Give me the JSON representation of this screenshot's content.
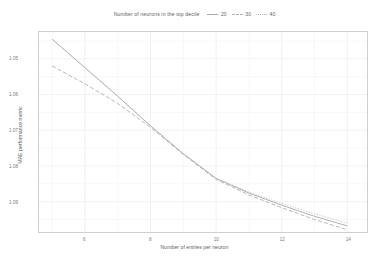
{
  "legend": {
    "title": "Number of neurons in the top decile",
    "entries": [
      {
        "label": "20",
        "color": "#a8a8a8",
        "dash": "none"
      },
      {
        "label": "30",
        "color": "#b0b0b0",
        "dash": "dashed"
      },
      {
        "label": "40",
        "color": "#bdbdbd",
        "dash": "dotted"
      }
    ]
  },
  "axes": {
    "xlabel": "Number of entries per neuron",
    "ylabel": "MAE performance metric",
    "xticks": [
      "6",
      "8",
      "10",
      "12",
      "14"
    ],
    "yticks": [
      "1.09",
      "1.08",
      "1.07",
      "1.06",
      "1.05"
    ]
  },
  "colors": {
    "frame": "#cfcfcf",
    "grid_major": "#ececec",
    "grid_minor": "#f4f4f4",
    "text": "#6b6b6b",
    "background": "#ffffff"
  },
  "chart_data": {
    "type": "line",
    "title": "Number of neurons in the top decile",
    "xlabel": "Number of entries per neuron",
    "ylabel": "MAE performance metric",
    "xlim": [
      4.6,
      14.6
    ],
    "ylim": [
      1.0415,
      1.0975
    ],
    "xticks": [
      6,
      8,
      10,
      12,
      14
    ],
    "yticks": [
      1.05,
      1.06,
      1.07,
      1.08,
      1.09
    ],
    "grid": true,
    "legend_position": "top-center",
    "x": [
      5,
      6,
      7,
      8,
      9,
      10,
      11,
      12,
      13,
      14
    ],
    "series": [
      {
        "name": "20",
        "color": "#a8a8a8",
        "dash": "none",
        "values": [
          1.0955,
          1.0875,
          1.0795,
          1.0712,
          1.0634,
          1.0565,
          1.0524,
          1.049,
          1.0459,
          1.0432
        ]
      },
      {
        "name": "30",
        "color": "#b0b0b0",
        "dash": "dashed",
        "values": [
          1.088,
          1.083,
          1.0775,
          1.0708,
          1.0632,
          1.0562,
          1.0519,
          1.0483,
          1.045,
          1.0421
        ]
      },
      {
        "name": "40",
        "color": "#bdbdbd",
        "dash": "dotted",
        "values": [
          1.0955,
          1.0876,
          1.0796,
          1.0713,
          1.0635,
          1.0566,
          1.0527,
          1.0495,
          1.0466,
          1.044
        ]
      }
    ]
  }
}
